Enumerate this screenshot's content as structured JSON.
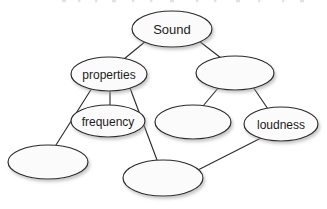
{
  "diagram": {
    "background_color": "#ffffff",
    "node_fill_color": "#fbfbfb",
    "node_stroke_color": "#2b2b2b",
    "edge_color": "#2e2e2e",
    "label_color": "#1b1b1b",
    "nodes": [
      {
        "id": "sound",
        "label": "Sound",
        "cx": 172,
        "cy": 29,
        "rx": 40,
        "ry": 18,
        "font_size": 13,
        "filled_label": true
      },
      {
        "id": "properties",
        "label": "properties",
        "cx": 109,
        "cy": 74,
        "rx": 38,
        "ry": 17,
        "font_size": 12,
        "filled_label": true
      },
      {
        "id": "unnamed-right-upper",
        "label": "",
        "cx": 235,
        "cy": 73,
        "rx": 39,
        "ry": 17,
        "font_size": 12,
        "filled_label": false
      },
      {
        "id": "frequency",
        "label": "frequency",
        "cx": 108,
        "cy": 121,
        "rx": 37,
        "ry": 16,
        "font_size": 12,
        "filled_label": true
      },
      {
        "id": "unnamed-middle",
        "label": "",
        "cx": 193,
        "cy": 122,
        "rx": 38,
        "ry": 17,
        "font_size": 12,
        "filled_label": false
      },
      {
        "id": "loudness",
        "label": "loudness",
        "cx": 281,
        "cy": 124,
        "rx": 37,
        "ry": 17,
        "font_size": 12,
        "filled_label": true
      },
      {
        "id": "unnamed-bottom-left",
        "label": "",
        "cx": 48,
        "cy": 162,
        "rx": 40,
        "ry": 17,
        "font_size": 12,
        "filled_label": false
      },
      {
        "id": "unnamed-bottom-center",
        "label": "",
        "cx": 163,
        "cy": 178,
        "rx": 40,
        "ry": 18,
        "font_size": 12,
        "filled_label": false
      }
    ],
    "edges": [
      {
        "id": "sound-properties",
        "from": "sound",
        "to": "properties",
        "x1": 146,
        "y1": 41,
        "x2": 124,
        "y2": 59
      },
      {
        "id": "sound-unnamed-right-upper",
        "from": "sound",
        "to": "unnamed-right-upper",
        "x1": 199,
        "y1": 41,
        "x2": 221,
        "y2": 58
      },
      {
        "id": "properties-unnamed-bottom-left",
        "from": "properties",
        "to": "unnamed-bottom-left",
        "x1": 92,
        "y1": 88,
        "x2": 56,
        "y2": 145
      },
      {
        "id": "properties-frequency",
        "from": "properties",
        "to": "frequency",
        "x1": 110,
        "y1": 91,
        "x2": 110,
        "y2": 105
      },
      {
        "id": "properties-unnamed-bottom-center",
        "from": "properties",
        "to": "unnamed-bottom-center",
        "x1": 130,
        "y1": 88,
        "x2": 157,
        "y2": 160
      },
      {
        "id": "unnamed-right-upper-unnamed-middle",
        "from": "unnamed-right-upper",
        "to": "unnamed-middle",
        "x1": 219,
        "y1": 87,
        "x2": 203,
        "y2": 106
      },
      {
        "id": "unnamed-right-upper-loudness",
        "from": "unnamed-right-upper",
        "to": "loudness",
        "x1": 253,
        "y1": 87,
        "x2": 268,
        "y2": 109
      },
      {
        "id": "loudness-unnamed-bottom-center",
        "from": "loudness",
        "to": "unnamed-bottom-center",
        "x1": 263,
        "y1": 137,
        "x2": 196,
        "y2": 171
      }
    ],
    "top_fragment": {
      "description": "faint cropped text descenders at top edge",
      "visible": true
    }
  }
}
